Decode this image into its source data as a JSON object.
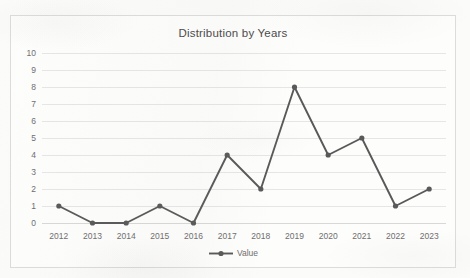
{
  "chart_data": {
    "type": "line",
    "title": "Distribution by Years",
    "xlabel": "",
    "ylabel": "",
    "categories": [
      "2012",
      "2013",
      "2014",
      "2015",
      "2016",
      "2017",
      "2018",
      "2019",
      "2020",
      "2021",
      "2022",
      "2023"
    ],
    "series": [
      {
        "name": "Value",
        "values": [
          1,
          0,
          0,
          1,
          0,
          4,
          2,
          8,
          4,
          5,
          1,
          2
        ]
      }
    ],
    "ylim": [
      0,
      10
    ],
    "ytick_labels": [
      "10",
      "9",
      "8",
      "7",
      "6",
      "5",
      "4",
      "3",
      "2",
      "1",
      "0"
    ],
    "ytick_values": [
      10,
      9,
      8,
      7,
      6,
      5,
      4,
      3,
      2,
      1,
      0
    ],
    "grid": true,
    "grid_axis": "y",
    "legend_position": "bottom",
    "line_color": "#595959",
    "marker_color": "#595959",
    "marker": "circle",
    "gridline_color": "#e6e6e6",
    "text_color": "#6e6e6e",
    "title_color": "#4a4a4a",
    "plot_background": "#fdfdfc",
    "border_color": "#dcdcdc"
  },
  "legend": {
    "entries": [
      {
        "label": "Value",
        "color": "#595959"
      }
    ]
  }
}
